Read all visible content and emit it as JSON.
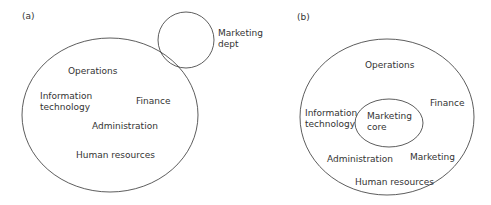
{
  "panel_a": {
    "tag": "(a)",
    "labels": {
      "operations": "Operations",
      "info_tech_1": "Information",
      "info_tech_2": "technology",
      "finance": "Finance",
      "administration": "Administration",
      "human_resources": "Human resources",
      "marketing_dept_1": "Marketing",
      "marketing_dept_2": "dept"
    }
  },
  "panel_b": {
    "tag": "(b)",
    "labels": {
      "operations": "Operations",
      "info_tech_1": "Information",
      "info_tech_2": "technology",
      "finance": "Finance",
      "marketing_core_1": "Marketing",
      "marketing_core_2": "core",
      "administration": "Administration",
      "marketing": "Marketing",
      "human_resources": "Human resources"
    }
  },
  "colors": {
    "stroke": "#333333",
    "text": "#333333",
    "background": "#ffffff"
  }
}
